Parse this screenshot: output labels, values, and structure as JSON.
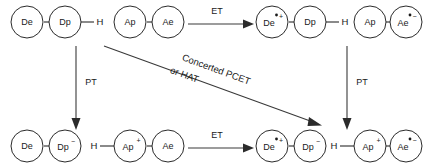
{
  "diagram": {
    "colors": {
      "stroke": "#2b2b2b",
      "arrow": "#3a3a3a",
      "text": "#1a1a1a",
      "background": "#ffffff"
    },
    "species": {
      "top_left": {
        "id": "reactant-donor",
        "nodes": [
          {
            "base": "De",
            "radical": false,
            "charge": ""
          },
          {
            "base": "Dp",
            "radical": false,
            "charge": ""
          }
        ],
        "h_left": "",
        "h_right": "H"
      },
      "top_mid": {
        "id": "reactant-acceptor",
        "nodes": [
          {
            "base": "Ap",
            "radical": false,
            "charge": ""
          },
          {
            "base": "Ae",
            "radical": false,
            "charge": ""
          }
        ],
        "h_left": "",
        "h_right": ""
      },
      "top_mid_right": {
        "id": "et-product-donor",
        "nodes": [
          {
            "base": "De",
            "radical": true,
            "charge": "+"
          },
          {
            "base": "Dp",
            "radical": false,
            "charge": ""
          }
        ],
        "h_left": "",
        "h_right": "H"
      },
      "top_right": {
        "id": "et-product-acceptor",
        "nodes": [
          {
            "base": "Ap",
            "radical": false,
            "charge": ""
          },
          {
            "base": "Ae",
            "radical": true,
            "charge": "−"
          }
        ],
        "h_left": "",
        "h_right": ""
      },
      "bottom_left": {
        "id": "pt-product-donor",
        "nodes": [
          {
            "base": "De",
            "radical": false,
            "charge": ""
          },
          {
            "base": "Dp",
            "radical": false,
            "charge": "−"
          }
        ],
        "h_left": "",
        "h_right": ""
      },
      "bottom_mid": {
        "id": "pt-product-acceptor",
        "nodes": [
          {
            "base": "Ap",
            "radical": false,
            "charge": "+"
          },
          {
            "base": "Ae",
            "radical": false,
            "charge": ""
          }
        ],
        "h_left": "H",
        "h_right": ""
      },
      "bottom_mid_right": {
        "id": "pcet-product-donor",
        "nodes": [
          {
            "base": "De",
            "radical": true,
            "charge": "+"
          },
          {
            "base": "Dp",
            "radical": false,
            "charge": "−"
          }
        ],
        "h_left": "",
        "h_right": ""
      },
      "bottom_right": {
        "id": "pcet-product-acceptor",
        "nodes": [
          {
            "base": "Ap",
            "radical": false,
            "charge": "+"
          },
          {
            "base": "Ae",
            "radical": true,
            "charge": "−"
          }
        ],
        "h_left": "H",
        "h_right": ""
      }
    },
    "arrows": {
      "et_top": {
        "label": "ET",
        "direction": "right"
      },
      "et_bottom": {
        "label": "ET",
        "direction": "right"
      },
      "pt_left": {
        "label": "PT",
        "direction": "down"
      },
      "pt_right": {
        "label": "PT",
        "direction": "down"
      },
      "concerted": {
        "label_line1": "Concerted PCET",
        "label_line2": "or HAT",
        "direction": "diagonal-down-right"
      }
    }
  }
}
